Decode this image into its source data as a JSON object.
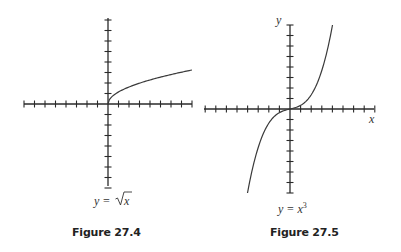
{
  "figures": [
    {
      "id": "fig1",
      "caption": "Figure 27.4",
      "equation_label": "y = √x",
      "equation_lhs": "y =",
      "equation_radicand": "x",
      "axis_labels": {
        "x": "",
        "y": ""
      },
      "ticks_per_half_axis": 8
    },
    {
      "id": "fig2",
      "caption": "Figure 27.5",
      "equation_label": "y = x³",
      "equation_lhs": "y = x",
      "equation_exponent": "3",
      "axis_labels": {
        "x": "x",
        "y": "y"
      },
      "ticks_per_half_axis": 8
    }
  ],
  "chart_data": [
    {
      "type": "line",
      "title": "Figure 27.4",
      "function": "y = sqrt(x)",
      "xlabel": "",
      "ylabel": "",
      "tick_labels": "none",
      "grid": false,
      "x_ticks": 16,
      "y_ticks": 16,
      "curve_domain": [
        0,
        8
      ],
      "points": [
        [
          0,
          0
        ],
        [
          1,
          1
        ],
        [
          2,
          1.41
        ],
        [
          4,
          2
        ],
        [
          6,
          2.45
        ],
        [
          8,
          2.83
        ]
      ]
    },
    {
      "type": "line",
      "title": "Figure 27.5",
      "function": "y = x^3",
      "xlabel": "x",
      "ylabel": "y",
      "tick_labels": "none",
      "grid": false,
      "x_ticks": 16,
      "y_ticks": 16,
      "curve_domain": [
        -2,
        2
      ],
      "points": [
        [
          -2,
          -8
        ],
        [
          -1,
          -1
        ],
        [
          0,
          0
        ],
        [
          1,
          1
        ],
        [
          2,
          8
        ]
      ]
    }
  ]
}
